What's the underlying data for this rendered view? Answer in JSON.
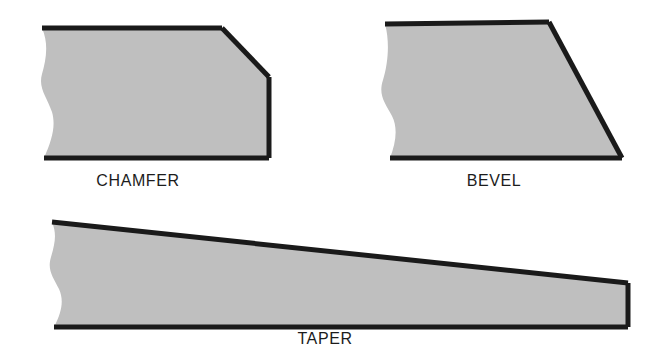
{
  "figure": {
    "background_color": "#ffffff",
    "fill_color": "#bfbfbf",
    "outline_color": "#1a1a1a",
    "label_color": "#1c1c1c",
    "title": "",
    "shapes": [
      {
        "id": "chamfer",
        "label": "CHAMFER",
        "label_x": 138,
        "label_y": 186,
        "description": "Rectangular bar end with a corner cut at 45 degrees; left side is a wavy break line",
        "body_path": "M 42 28 L 222 28 L 269 77 L 269 158 L 44 158 C 52 140 56 126 52 112 C 47 97 38 88 42 74 C 46 60 49 44 42 28 Z",
        "outline_paths": [
          "M 42 28 L 222 28 L 269 77 L 269 158 L 44 158",
          "M 44 158 C 52 140 56 126 52 112 C 47 97 38 88 42 74 C 46 60 49 44 42 28"
        ],
        "drawn_outline_segments": [
          "M 42 28 L 222 28",
          "M 222 28 L 269 77",
          "M 269 77 L 269 158",
          "M 269 158 L 44 158"
        ]
      },
      {
        "id": "bevel",
        "label": "BEVEL",
        "label_x": 494,
        "label_y": 186,
        "description": "Bar end cut on a single slanted face running the full height; left side is a wavy break line",
        "body_path": "M 385 24 L 549 22 L 622 158 L 390 158 C 396 142 398 128 392 116 C 385 103 378 95 383 80 C 388 64 390 42 385 24 Z",
        "drawn_outline_segments": [
          "M 385 24 L 549 22",
          "M 549 22 L 622 158",
          "M 622 158 L 390 158"
        ]
      },
      {
        "id": "taper",
        "label": "TAPER",
        "label_x": 325,
        "label_y": 344,
        "description": "Long wedge whose top surface slopes gradually to a narrow squared end at the right; left side is a wavy break line",
        "body_path": "M 52 222 L 628 283 L 628 327 L 54 327 C 62 312 64 300 59 289 C 53 277 47 270 51 257 C 55 243 57 234 52 222 Z",
        "drawn_outline_segments": [
          "M 52 222 L 628 283",
          "M 628 283 L 628 327",
          "M 628 327 L 54 327"
        ]
      }
    ]
  }
}
